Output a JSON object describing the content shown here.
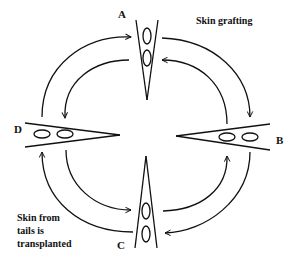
{
  "diagram": {
    "title": "Skin grafting",
    "note_lines": [
      "Skin from",
      "tails is",
      "transplanted"
    ],
    "nodes": [
      {
        "id": "A",
        "label": "A",
        "position": "top",
        "grafts": 2
      },
      {
        "id": "B",
        "label": "B",
        "position": "right",
        "grafts": 2
      },
      {
        "id": "C",
        "label": "C",
        "position": "bottom",
        "grafts": 2
      },
      {
        "id": "D",
        "label": "D",
        "position": "left",
        "grafts": 2
      }
    ],
    "arrows": [
      {
        "from": "D",
        "to": "A"
      },
      {
        "from": "A",
        "to": "D"
      },
      {
        "from": "A",
        "to": "B"
      },
      {
        "from": "B",
        "to": "A"
      },
      {
        "from": "B",
        "to": "C"
      },
      {
        "from": "C",
        "to": "B"
      },
      {
        "from": "C",
        "to": "D"
      },
      {
        "from": "D",
        "to": "C"
      }
    ],
    "colors": {
      "line": "#111111",
      "background": "#ffffff"
    }
  }
}
